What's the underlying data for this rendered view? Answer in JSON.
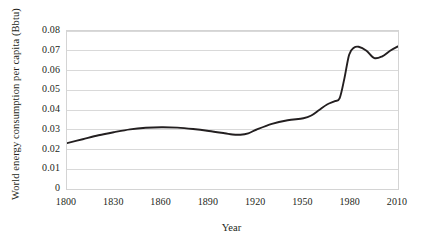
{
  "chart_data": {
    "type": "line",
    "title": "",
    "xlabel": "Year",
    "ylabel": "World energy consumption per capita (Bbtu)",
    "xlim": [
      1800,
      2010
    ],
    "ylim": [
      0,
      0.08
    ],
    "grid": true,
    "legend": false,
    "xticks": [
      "1800",
      "1830",
      "1860",
      "1890",
      "1920",
      "1950",
      "1980",
      "2010"
    ],
    "xtick_values": [
      1800,
      1830,
      1860,
      1890,
      1920,
      1950,
      1980,
      2010
    ],
    "yticks": [
      "0",
      "0.01",
      "0.02",
      "0.03",
      "0.04",
      "0.05",
      "0.06",
      "0.07",
      "0.08"
    ],
    "ytick_values": [
      0,
      0.01,
      0.02,
      0.03,
      0.04,
      0.05,
      0.06,
      0.07,
      0.08
    ],
    "series": [
      {
        "name": "World energy consumption per capita",
        "color": "#231f20",
        "x": [
          1800,
          1810,
          1820,
          1830,
          1840,
          1850,
          1860,
          1870,
          1880,
          1890,
          1900,
          1905,
          1910,
          1915,
          1920,
          1930,
          1940,
          1950,
          1955,
          1960,
          1965,
          1970,
          1973,
          1976,
          1979,
          1982,
          1985,
          1990,
          1995,
          2000,
          2005,
          2010
        ],
        "values": [
          0.0232,
          0.0252,
          0.0272,
          0.0288,
          0.0302,
          0.031,
          0.0313,
          0.0311,
          0.0304,
          0.0294,
          0.0282,
          0.0276,
          0.0275,
          0.0282,
          0.03,
          0.033,
          0.0348,
          0.0358,
          0.0372,
          0.04,
          0.0428,
          0.0445,
          0.046,
          0.056,
          0.068,
          0.0715,
          0.072,
          0.07,
          0.0663,
          0.0672,
          0.07,
          0.0722
        ]
      }
    ]
  },
  "axes": {
    "y_title": "World energy consumption per capita (Bbtu)",
    "x_title": "Year"
  }
}
